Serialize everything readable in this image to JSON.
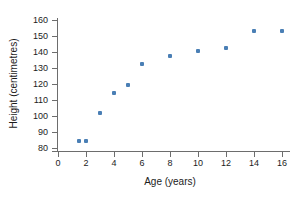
{
  "chart_data": {
    "type": "scatter",
    "title": "",
    "xlabel": "Age (years)",
    "ylabel": "Height (centimetres)",
    "xlim": [
      0,
      16
    ],
    "ylim": [
      80,
      160
    ],
    "xticks": [
      0,
      2,
      4,
      6,
      8,
      10,
      12,
      14,
      16
    ],
    "yticks": [
      80,
      90,
      100,
      110,
      120,
      130,
      140,
      150,
      160
    ],
    "grid": false,
    "legend": null,
    "series": [
      {
        "name": "Height vs Age",
        "color": "#4a7fb5",
        "marker": "square",
        "points": [
          {
            "x": 1.5,
            "y": 84.5
          },
          {
            "x": 2.0,
            "y": 84.5
          },
          {
            "x": 3.0,
            "y": 102.0
          },
          {
            "x": 4.0,
            "y": 114.5
          },
          {
            "x": 5.0,
            "y": 119.5
          },
          {
            "x": 6.0,
            "y": 132.5
          },
          {
            "x": 8.0,
            "y": 137.5
          },
          {
            "x": 10.0,
            "y": 140.5
          },
          {
            "x": 12.0,
            "y": 142.5
          },
          {
            "x": 14.0,
            "y": 153.0
          },
          {
            "x": 16.0,
            "y": 153.0
          }
        ]
      }
    ]
  },
  "colors": {
    "marker": "#4a7fb5",
    "axis": "#6d6d6d",
    "text": "#1c1c1c",
    "background": "#ffffff"
  }
}
